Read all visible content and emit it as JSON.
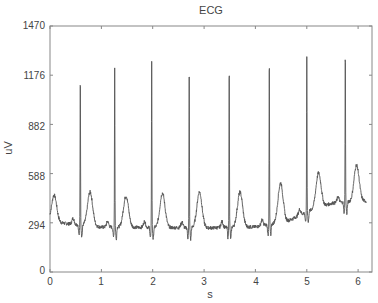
{
  "chart_data": {
    "type": "line",
    "title": "ECG",
    "xlabel": "s",
    "ylabel": "uV",
    "xlim": [
      0,
      6.27
    ],
    "ylim": [
      0,
      1470
    ],
    "xticks": [
      0,
      1,
      2,
      3,
      4,
      5,
      6
    ],
    "yticks": [
      0,
      294,
      588,
      882,
      1176,
      1470
    ],
    "grid": false,
    "legend": null,
    "line_color": "#555555",
    "r_peaks": {
      "t": [
        0.59,
        1.26,
        1.98,
        2.71,
        3.49,
        4.27,
        5.0,
        5.75
      ],
      "uV": [
        1219,
        1225,
        1267,
        1267,
        1273,
        1315,
        1291,
        1363
      ]
    },
    "t_waves": {
      "t": [
        0.08,
        0.78,
        1.48,
        2.19,
        2.91,
        3.7,
        4.49,
        5.23,
        5.97
      ],
      "uV": [
        460,
        478,
        454,
        472,
        478,
        478,
        532,
        592,
        640
      ]
    },
    "baseline": {
      "t": [
        0.0,
        1.0,
        2.0,
        3.0,
        4.0,
        4.6,
        5.0,
        5.5,
        6.1
      ],
      "uV": [
        300,
        268,
        266,
        263,
        270,
        300,
        360,
        412,
        424
      ]
    }
  },
  "labels": {
    "title": "ECG",
    "xlabel": "s",
    "ylabel": "uV",
    "yticks": [
      "0",
      "294",
      "588",
      "882",
      "1176",
      "1470"
    ],
    "xticks": [
      "0",
      "1",
      "2",
      "3",
      "4",
      "5",
      "6"
    ]
  }
}
